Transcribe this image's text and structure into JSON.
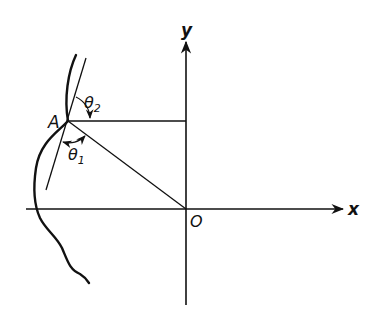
{
  "diagram": {
    "type": "geometry",
    "colors": {
      "ink": "#111111",
      "background": "#ffffff"
    },
    "axes": {
      "x_label": "x",
      "y_label": "y",
      "origin_label": "O"
    },
    "points": {
      "A": {
        "label": "A"
      }
    },
    "angles": {
      "theta1": {
        "symbol": "θ",
        "subscript": "1"
      },
      "theta2": {
        "symbol": "θ",
        "subscript": "2"
      }
    }
  }
}
